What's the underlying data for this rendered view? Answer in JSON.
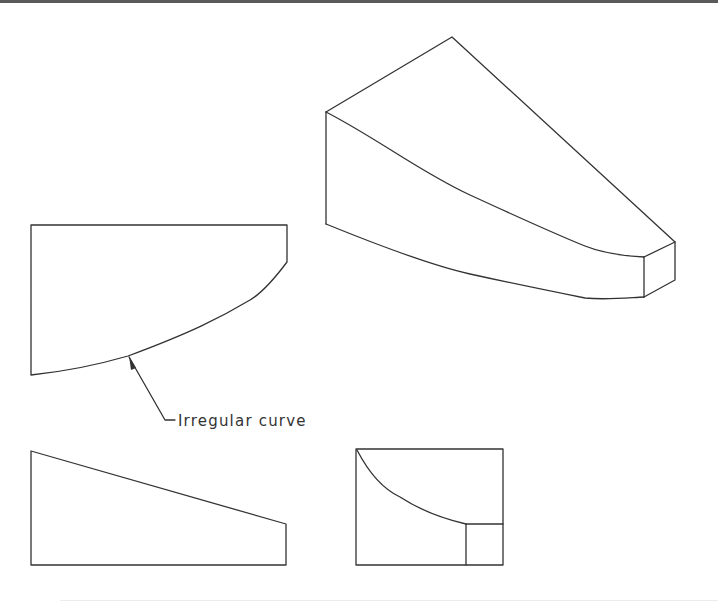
{
  "figure": {
    "type": "orthographic-and-isometric-projection",
    "stroke_color": "#333333",
    "rule_color": "#5a5a5a",
    "annotation": {
      "text": "Irregular curve",
      "target": "front-view curved edge"
    },
    "views": [
      {
        "name": "isometric-view",
        "description": "3D wedge block with irregular curved face"
      },
      {
        "name": "front-view",
        "description": "Rectangle with irregular curve bottom edge"
      },
      {
        "name": "top-view",
        "description": "Trapezoid with sloped top edge"
      },
      {
        "name": "side-view",
        "description": "Rectangle with concave curve and small square corner"
      }
    ]
  }
}
